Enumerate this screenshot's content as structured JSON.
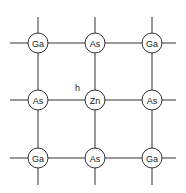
{
  "diagram": {
    "grid": {
      "x": [
        38,
        95,
        152
      ],
      "y": [
        43,
        100,
        158
      ],
      "radius": 10,
      "stub_min_x": 10,
      "stub_max_x": 176,
      "stub_min_y": 17,
      "stub_max_y": 185
    },
    "atoms": [
      {
        "row": 0,
        "col": 0,
        "label": "Ga"
      },
      {
        "row": 0,
        "col": 1,
        "label": "As"
      },
      {
        "row": 0,
        "col": 2,
        "label": "Ga"
      },
      {
        "row": 1,
        "col": 0,
        "label": "As"
      },
      {
        "row": 1,
        "col": 1,
        "label": "Zn"
      },
      {
        "row": 1,
        "col": 2,
        "label": "As"
      },
      {
        "row": 2,
        "col": 0,
        "label": "Ga"
      },
      {
        "row": 2,
        "col": 1,
        "label": "As"
      },
      {
        "row": 2,
        "col": 2,
        "label": "Ga"
      }
    ],
    "annotations": [
      {
        "label": "h",
        "x": 75,
        "y": 91
      }
    ]
  }
}
